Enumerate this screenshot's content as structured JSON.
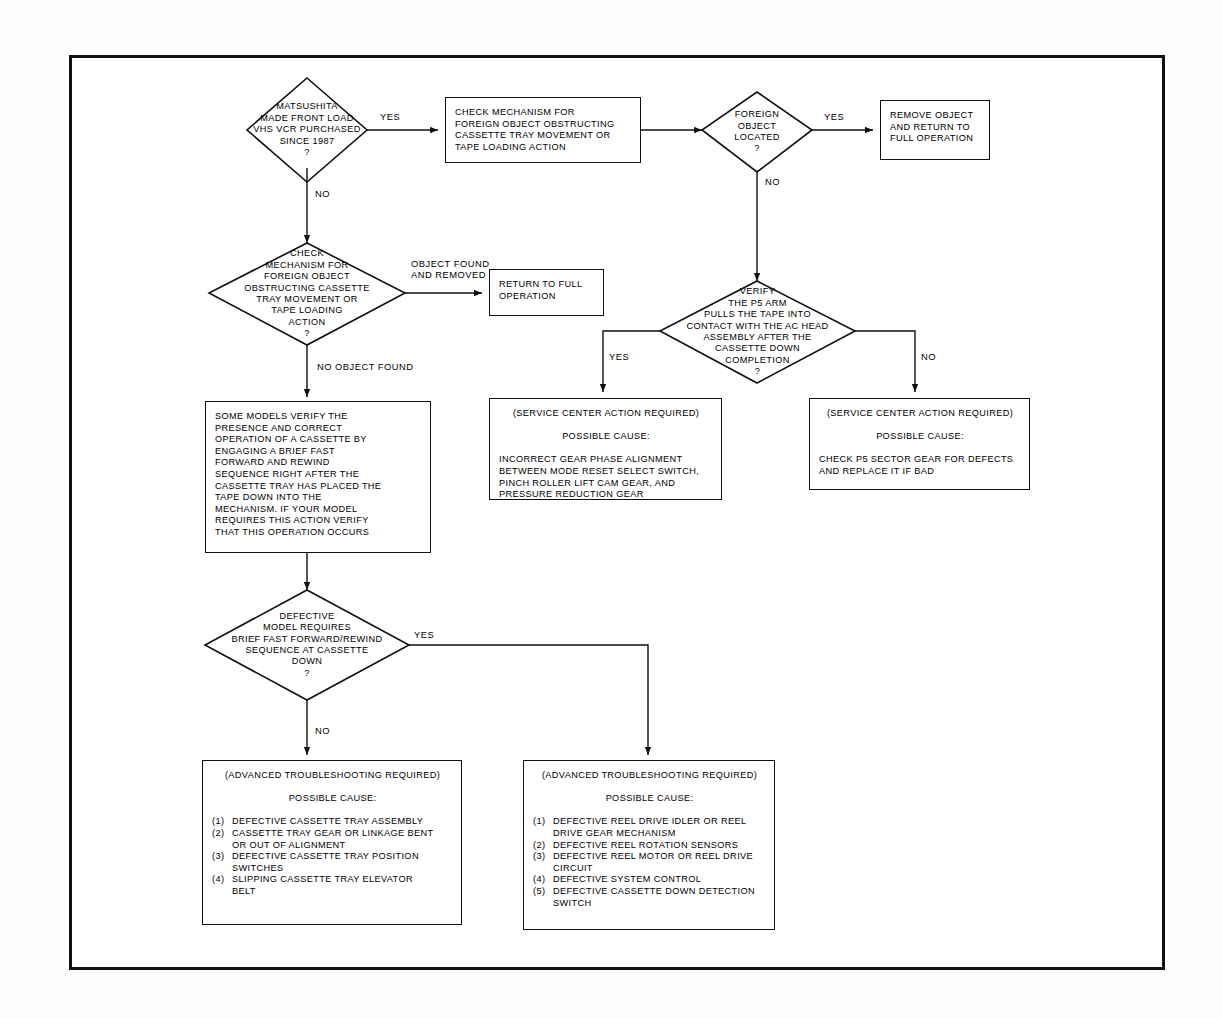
{
  "diagram": {
    "colors": {
      "line": "#111111",
      "background": "#ffffff",
      "text": "#000000"
    },
    "nodes": {
      "d1_matsushita": {
        "type": "decision",
        "lines": [
          "MATSUSHITA",
          "MADE FRONT LOAD",
          "VHS VCR PURCHASED",
          "SINCE 1987",
          "?"
        ]
      },
      "p1_check_mechanism": {
        "type": "process",
        "lines": [
          "CHECK MECHANISM FOR",
          "FOREIGN OBJECT OBSTRUCTING",
          "CASSETTE TRAY MOVEMENT OR",
          "TAPE LOADING ACTION"
        ]
      },
      "d2_foreign_object_located": {
        "type": "decision",
        "lines": [
          "FOREIGN",
          "OBJECT",
          "LOCATED",
          "?"
        ]
      },
      "p2_remove_object": {
        "type": "process",
        "lines": [
          "REMOVE OBJECT",
          "AND RETURN TO",
          "FULL OPERATION"
        ]
      },
      "d3_check_for_mechanism": {
        "type": "decision",
        "lines": [
          "CHECK",
          "MECHANISM FOR",
          "FOREIGN OBJECT",
          "OBSTRUCTING CASSETTE",
          "TRAY MOVEMENT OR",
          "TAPE LOADING",
          "ACTION",
          "?"
        ]
      },
      "p3_return_full_operation": {
        "type": "process",
        "lines": [
          "RETURN TO FULL",
          "OPERATION"
        ]
      },
      "d4_verify_p5_arm": {
        "type": "decision",
        "lines": [
          "VERIFY",
          "THE P5 ARM",
          "PULLS THE TAPE INTO",
          "CONTACT WITH THE AC HEAD",
          "ASSEMBLY AFTER THE",
          "CASSETTE DOWN",
          "COMPLETION",
          "?"
        ]
      },
      "p4_some_models_verify": {
        "type": "process",
        "lines": [
          "SOME MODELS VERIFY THE",
          "PRESENCE AND CORRECT",
          "OPERATION OF A CASSETTE BY",
          "ENGAGING A BRIEF FAST",
          "FORWARD AND REWIND",
          "SEQUENCE RIGHT AFTER THE",
          "CASSETTE TRAY HAS PLACED THE",
          "TAPE DOWN INTO THE",
          "MECHANISM. IF YOUR MODEL",
          "REQUIRES THIS ACTION VERIFY",
          "THAT THIS OPERATION OCCURS"
        ]
      },
      "p5_service_center_gear_phase": {
        "type": "process",
        "header": "(SERVICE CENTER ACTION REQUIRED)",
        "subheader": "POSSIBLE CAUSE:",
        "body": [
          "INCORRECT GEAR PHASE ALIGNMENT",
          "BETWEEN MODE RESET SELECT SWITCH,",
          "PINCH ROLLER LIFT CAM GEAR, AND",
          "PRESSURE REDUCTION GEAR"
        ]
      },
      "p6_service_center_p5_sector": {
        "type": "process",
        "header": "(SERVICE CENTER ACTION REQUIRED)",
        "subheader": "POSSIBLE CAUSE:",
        "body": [
          "CHECK P5 SECTOR GEAR FOR DEFECTS",
          "AND REPLACE IT IF BAD"
        ]
      },
      "d5_defective_model": {
        "type": "decision",
        "lines": [
          "DEFECTIVE",
          "MODEL REQUIRES",
          "BRIEF FAST FORWARD/REWIND",
          "SEQUENCE AT CASSETTE",
          "DOWN",
          "?"
        ]
      },
      "p7_advanced_tray": {
        "type": "process",
        "header": "(ADVANCED TROUBLESHOOTING REQUIRED)",
        "subheader": "POSSIBLE CAUSE:",
        "items": [
          {
            "num": "(1)",
            "text": "DEFECTIVE CASSETTE TRAY ASSEMBLY"
          },
          {
            "num": "(2)",
            "text": "CASSETTE TRAY GEAR OR LINKAGE BENT\nOR OUT OF ALIGNMENT"
          },
          {
            "num": "(3)",
            "text": "DEFECTIVE CASSETTE TRAY POSITION\nSWITCHES"
          },
          {
            "num": "(4)",
            "text": "SLIPPING CASSETTE TRAY ELEVATOR\nBELT"
          }
        ]
      },
      "p8_advanced_reel": {
        "type": "process",
        "header": "(ADVANCED TROUBLESHOOTING REQUIRED)",
        "subheader": "POSSIBLE CAUSE:",
        "items": [
          {
            "num": "(1)",
            "text": "DEFECTIVE REEL DRIVE IDLER OR REEL\nDRIVE GEAR MECHANISM"
          },
          {
            "num": "(2)",
            "text": "DEFECTIVE REEL ROTATION SENSORS"
          },
          {
            "num": "(3)",
            "text": "DEFECTIVE REEL MOTOR OR REEL DRIVE\nCIRCUIT"
          },
          {
            "num": "(4)",
            "text": "DEFECTIVE SYSTEM CONTROL"
          },
          {
            "num": "(5)",
            "text": "DEFECTIVE CASSETTE DOWN DETECTION\nSWITCH"
          }
        ]
      }
    },
    "edge_labels": {
      "yes_1": "YES",
      "no_1": "NO",
      "yes_2": "YES",
      "no_2": "NO",
      "object_found_removed": "OBJECT FOUND\nAND REMOVED",
      "no_object_found": "NO OBJECT FOUND",
      "yes_3": "YES",
      "no_3": "NO",
      "yes_4": "YES",
      "no_4": "NO"
    }
  }
}
